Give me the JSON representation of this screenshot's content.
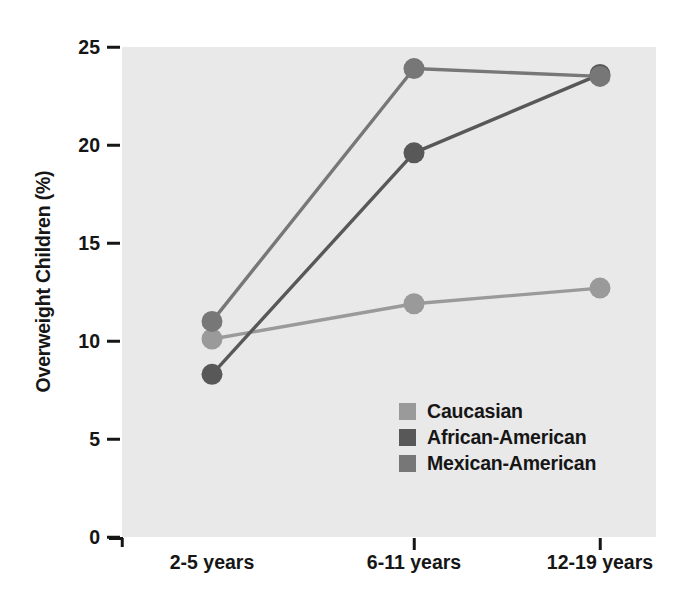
{
  "chart_data": {
    "type": "line",
    "title": "",
    "xlabel": "",
    "ylabel": "Overweight Children (%)",
    "categories": [
      "2-5 years",
      "6-11 years",
      "12-19 years"
    ],
    "ylim": [
      0,
      25
    ],
    "yticks": [
      0,
      5,
      10,
      15,
      20,
      25
    ],
    "ytick_labels": [
      "0",
      "5",
      "10",
      "15",
      "20",
      "25"
    ],
    "grid": false,
    "legend_position": "center",
    "series": [
      {
        "name": "Caucasian",
        "values": [
          10.1,
          11.9,
          12.7
        ],
        "color": "#9a9a9a"
      },
      {
        "name": "African-American",
        "values": [
          8.3,
          19.6,
          23.6
        ],
        "color": "#585858"
      },
      {
        "name": "Mexican-American",
        "values": [
          11.0,
          23.9,
          23.5
        ],
        "color": "#777777"
      }
    ]
  },
  "legend": {
    "items": [
      {
        "label": "Caucasian",
        "swatch_name": "legend-swatch-caucasian",
        "color": "#9a9a9a"
      },
      {
        "label": "African-American",
        "swatch_name": "legend-swatch-african-american",
        "color": "#585858"
      },
      {
        "label": "Mexican-American",
        "swatch_name": "legend-swatch-mexican-american",
        "color": "#777777"
      }
    ]
  },
  "panel": {
    "background_color": "#e9e9e9",
    "axis_color": "#161616"
  }
}
